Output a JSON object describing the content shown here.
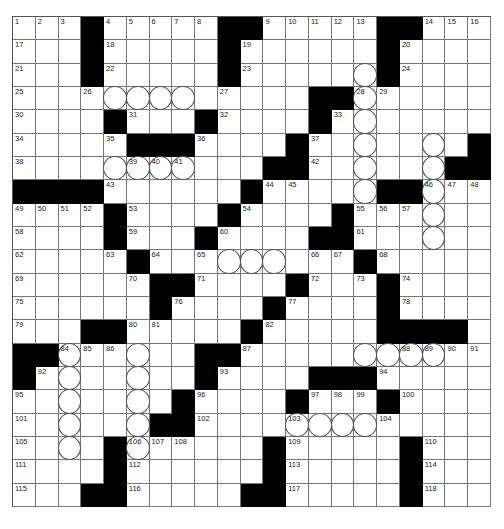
{
  "puzzle": {
    "rows": 21,
    "cols": 21,
    "layout": [
      "...#.....##.....##...",
      "...#.....#......#....",
      "...#.....#......#....",
      ".............##......",
      "....#...#....#.......",
      ".....###....#.......#",
      "...........##......##",
      "####......#.....##...",
      "....#....#....#......",
      "....#...#....##......",
      ".....#.........#.....",
      "......##....#...#....",
      "......#....#....#....",
      "...##.....#.....####.",
      "##......##..........",
      "#.......#....###.....",
      ".......#....#...#....",
      "......##.............",
      "....#......#.....#...",
      "....#......#.....#...",
      "...##.....##.....#..."
    ],
    "numbers": [
      [
        0,
        0,
        1
      ],
      [
        0,
        1,
        2
      ],
      [
        0,
        2,
        3
      ],
      [
        0,
        4,
        4
      ],
      [
        0,
        5,
        5
      ],
      [
        0,
        6,
        6
      ],
      [
        0,
        7,
        7
      ],
      [
        0,
        8,
        8
      ],
      [
        0,
        11,
        9
      ],
      [
        0,
        12,
        10
      ],
      [
        0,
        13,
        11
      ],
      [
        0,
        14,
        12
      ],
      [
        0,
        15,
        13
      ],
      [
        0,
        18,
        14
      ],
      [
        0,
        19,
        15
      ],
      [
        0,
        20,
        16
      ],
      [
        1,
        0,
        17
      ],
      [
        1,
        4,
        18
      ],
      [
        1,
        10,
        19
      ],
      [
        1,
        17,
        20
      ],
      [
        2,
        0,
        21
      ],
      [
        2,
        4,
        22
      ],
      [
        2,
        10,
        23
      ],
      [
        2,
        17,
        24
      ],
      [
        3,
        0,
        25
      ],
      [
        3,
        3,
        26
      ],
      [
        3,
        9,
        27
      ],
      [
        3,
        15,
        28
      ],
      [
        3,
        16,
        29
      ],
      [
        4,
        0,
        30
      ],
      [
        4,
        5,
        31
      ],
      [
        4,
        9,
        32
      ],
      [
        4,
        14,
        33
      ],
      [
        5,
        0,
        34
      ],
      [
        5,
        4,
        35
      ],
      [
        5,
        8,
        36
      ],
      [
        5,
        13,
        37
      ],
      [
        6,
        0,
        38
      ],
      [
        6,
        5,
        39
      ],
      [
        6,
        6,
        40
      ],
      [
        6,
        7,
        41
      ],
      [
        6,
        13,
        42
      ],
      [
        7,
        4,
        43
      ],
      [
        7,
        11,
        44
      ],
      [
        7,
        12,
        45
      ],
      [
        7,
        18,
        46
      ],
      [
        7,
        19,
        47
      ],
      [
        7,
        20,
        48
      ],
      [
        8,
        0,
        49
      ],
      [
        8,
        1,
        50
      ],
      [
        8,
        2,
        51
      ],
      [
        8,
        3,
        52
      ],
      [
        8,
        5,
        53
      ],
      [
        8,
        10,
        54
      ],
      [
        8,
        15,
        55
      ],
      [
        8,
        16,
        56
      ],
      [
        8,
        17,
        57
      ],
      [
        9,
        0,
        58
      ],
      [
        9,
        5,
        59
      ],
      [
        9,
        9,
        60
      ],
      [
        9,
        15,
        61
      ],
      [
        10,
        0,
        62
      ],
      [
        10,
        4,
        63
      ],
      [
        10,
        6,
        64
      ],
      [
        10,
        8,
        65
      ],
      [
        10,
        13,
        66
      ],
      [
        10,
        14,
        67
      ],
      [
        10,
        16,
        68
      ],
      [
        11,
        0,
        69
      ],
      [
        11,
        5,
        70
      ],
      [
        11,
        8,
        71
      ],
      [
        11,
        13,
        72
      ],
      [
        11,
        15,
        73
      ],
      [
        11,
        17,
        74
      ],
      [
        12,
        0,
        75
      ],
      [
        12,
        7,
        76
      ],
      [
        12,
        12,
        77
      ],
      [
        12,
        17,
        78
      ],
      [
        13,
        0,
        79
      ],
      [
        13,
        5,
        80
      ],
      [
        13,
        6,
        81
      ],
      [
        13,
        11,
        82
      ],
      [
        13,
        16,
        83
      ],
      [
        14,
        2,
        84
      ],
      [
        14,
        3,
        85
      ],
      [
        14,
        4,
        86
      ],
      [
        14,
        10,
        87
      ],
      [
        14,
        17,
        88
      ],
      [
        14,
        18,
        89
      ],
      [
        14,
        19,
        90
      ],
      [
        14,
        20,
        91
      ],
      [
        15,
        1,
        92
      ],
      [
        15,
        9,
        93
      ],
      [
        15,
        16,
        94
      ],
      [
        16,
        0,
        95
      ],
      [
        16,
        8,
        96
      ],
      [
        16,
        13,
        97
      ],
      [
        16,
        14,
        98
      ],
      [
        16,
        15,
        99
      ],
      [
        16,
        17,
        100
      ],
      [
        17,
        0,
        101
      ],
      [
        17,
        8,
        102
      ],
      [
        17,
        12,
        103
      ],
      [
        17,
        16,
        104
      ],
      [
        18,
        0,
        105
      ],
      [
        18,
        5,
        106
      ],
      [
        18,
        6,
        107
      ],
      [
        18,
        7,
        108
      ],
      [
        18,
        12,
        109
      ],
      [
        18,
        18,
        110
      ],
      [
        19,
        0,
        111
      ],
      [
        19,
        5,
        112
      ],
      [
        19,
        12,
        113
      ],
      [
        19,
        18,
        114
      ],
      [
        20,
        0,
        115
      ],
      [
        20,
        5,
        116
      ],
      [
        20,
        12,
        117
      ],
      [
        20,
        18,
        118
      ]
    ],
    "circles": [
      [
        2,
        15
      ],
      [
        3,
        4
      ],
      [
        3,
        5
      ],
      [
        3,
        6
      ],
      [
        3,
        7
      ],
      [
        3,
        15
      ],
      [
        4,
        15
      ],
      [
        5,
        15
      ],
      [
        5,
        18
      ],
      [
        6,
        4
      ],
      [
        6,
        5
      ],
      [
        6,
        6
      ],
      [
        6,
        7
      ],
      [
        6,
        15
      ],
      [
        6,
        18
      ],
      [
        7,
        15
      ],
      [
        7,
        18
      ],
      [
        8,
        18
      ],
      [
        9,
        18
      ],
      [
        10,
        9
      ],
      [
        10,
        10
      ],
      [
        10,
        11
      ],
      [
        14,
        2
      ],
      [
        14,
        5
      ],
      [
        14,
        15
      ],
      [
        14,
        16
      ],
      [
        14,
        17
      ],
      [
        14,
        18
      ],
      [
        15,
        2
      ],
      [
        15,
        5
      ],
      [
        16,
        2
      ],
      [
        16,
        5
      ],
      [
        17,
        2
      ],
      [
        17,
        5
      ],
      [
        17,
        12
      ],
      [
        17,
        13
      ],
      [
        17,
        14
      ],
      [
        17,
        15
      ],
      [
        18,
        2
      ],
      [
        18,
        5
      ]
    ]
  },
  "colors": {
    "black_square": "#000000",
    "grid_line": "#777777",
    "background": "#ffffff"
  }
}
